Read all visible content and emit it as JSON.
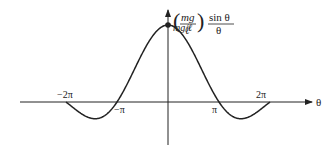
{
  "diagram": {
    "y_label": {
      "open": "(",
      "num": "mg",
      "den": "ℓ",
      "close": ")",
      "frac_num": "sin θ",
      "frac_den": "θ"
    },
    "peak_label": "mg/ℓ",
    "x_axis_label": "θ",
    "ticks": [
      {
        "label": "−2π",
        "value": -6.2832
      },
      {
        "label": "−π",
        "value": -3.1416
      },
      {
        "label": "π",
        "value": 3.1416
      },
      {
        "label": "2π",
        "value": 6.2832
      }
    ],
    "curve": "y = (mg/ℓ) sin θ / θ, θ ∈ [−2π, 2π]",
    "colors": {
      "ink": "#222222",
      "background": "#ffffff"
    }
  }
}
